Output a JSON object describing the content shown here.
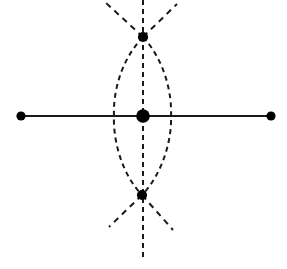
{
  "figure": {
    "kind": "diagram",
    "title": "",
    "caption": "",
    "canvas": {
      "width": 287,
      "height": 269,
      "background": "#ffffff"
    },
    "colors": {
      "stroke": "#1a1a1a",
      "node_fill": "#000000",
      "background": "#ffffff"
    },
    "style": {
      "solid_line_width": 2.1,
      "dashed_line_width": 2.0,
      "dash_pattern": "5 4",
      "dash_pattern_rays": "6 5"
    },
    "nodes": [
      {
        "id": "left-endpoint",
        "label": "",
        "x": 21,
        "y": 116,
        "r": 4.6,
        "role": "axis-endpoint"
      },
      {
        "id": "right-endpoint",
        "label": "",
        "x": 271,
        "y": 116,
        "r": 4.6,
        "role": "axis-endpoint"
      },
      {
        "id": "center-node",
        "label": "",
        "x": 143,
        "y": 116,
        "r": 6.8,
        "role": "center"
      },
      {
        "id": "top-node",
        "label": "",
        "x": 143,
        "y": 37,
        "r": 5.1,
        "role": "pole"
      },
      {
        "id": "bottom-node",
        "label": "",
        "x": 142,
        "y": 195,
        "r": 5.1,
        "role": "pole"
      }
    ],
    "edges": [
      {
        "id": "horizontal-axis",
        "style": "solid",
        "from": "left-endpoint",
        "to": "right-endpoint",
        "path": "M 21 116 L 271 116"
      },
      {
        "id": "vertical-dashed-axis",
        "style": "dashed",
        "path": "M 143 0 L 143 258"
      },
      {
        "id": "arc-left",
        "style": "dashed",
        "path": "M 143 37 C 119 62 113 96 114 116 C 113 137 120 172 142 195"
      },
      {
        "id": "arc-right",
        "style": "dashed",
        "path": "M 143 37 C 166 62 172 96 171 116 C 172 137 164 172 142 195"
      }
    ],
    "rays": [
      {
        "id": "ray-top-left",
        "style": "dashed",
        "path": "M 143 37 L 105 2"
      },
      {
        "id": "ray-top-right",
        "style": "dashed",
        "path": "M 143 37 L 177 4"
      },
      {
        "id": "ray-bottom-left",
        "style": "dashed",
        "path": "M 142 195 L 109 227"
      },
      {
        "id": "ray-bottom-right",
        "style": "dashed",
        "path": "M 142 195 L 173 230"
      }
    ]
  }
}
